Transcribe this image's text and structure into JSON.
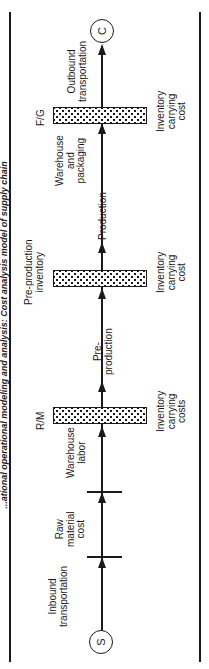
{
  "title": "...ational operational modeling and analysis: Cost analysis model of supply chain",
  "nodes": {
    "start": "S",
    "end": "C"
  },
  "inventory_points": [
    {
      "label": "R/M",
      "cost_label": "Inventory\ncarrying\ncosts"
    },
    {
      "label": "Pre-production\ninventory",
      "cost_label": "Inventory\ncarrying\ncost"
    },
    {
      "label": "F/G",
      "cost_label": "Inventory\ncarrying\ncost"
    }
  ],
  "flow_segments": [
    {
      "label": "Inbound\ntransportation"
    },
    {
      "label": "Raw\nmaterial\ncost"
    },
    {
      "label": "Warehouse\nlabor"
    },
    {
      "label": "Pre-\nproduction"
    },
    {
      "label": "Production"
    },
    {
      "label": "Warehouse\nand\npackaging"
    },
    {
      "label": "Outbound\ntransportation"
    }
  ],
  "colors": {
    "ink": "#1a1a1a",
    "background": "#ffffff"
  }
}
